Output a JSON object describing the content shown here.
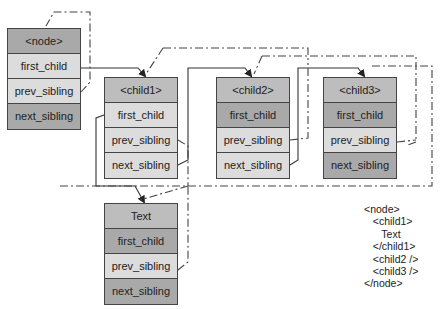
{
  "nodes": {
    "node": {
      "title": "<node>",
      "first_child": "first_child",
      "prev_sibling": "prev_sibling",
      "next_sibling": "next_sibling"
    },
    "child1": {
      "title": "<child1>",
      "first_child": "first_child",
      "prev_sibling": "prev_sibling",
      "next_sibling": "next_sibling"
    },
    "child2": {
      "title": "<child2>",
      "first_child": "first_child",
      "prev_sibling": "prev_sibling",
      "next_sibling": "next_sibling"
    },
    "child3": {
      "title": "<child3>",
      "first_child": "first_child",
      "prev_sibling": "prev_sibling",
      "next_sibling": "next_sibling"
    },
    "text": {
      "title": "Text",
      "first_child": "first_child",
      "prev_sibling": "prev_sibling",
      "next_sibling": "next_sibling"
    }
  },
  "xml_listing": {
    "lines": [
      "<node>",
      "   <child1>",
      "      Text",
      "   </child1>",
      "   <child2 />",
      "   <child3 />",
      "</node>"
    ]
  },
  "colors": {
    "header": "#a9a9a9",
    "null_field": "#a9a9a9",
    "set_field": "#dcdcdc",
    "stroke": "#333333"
  }
}
